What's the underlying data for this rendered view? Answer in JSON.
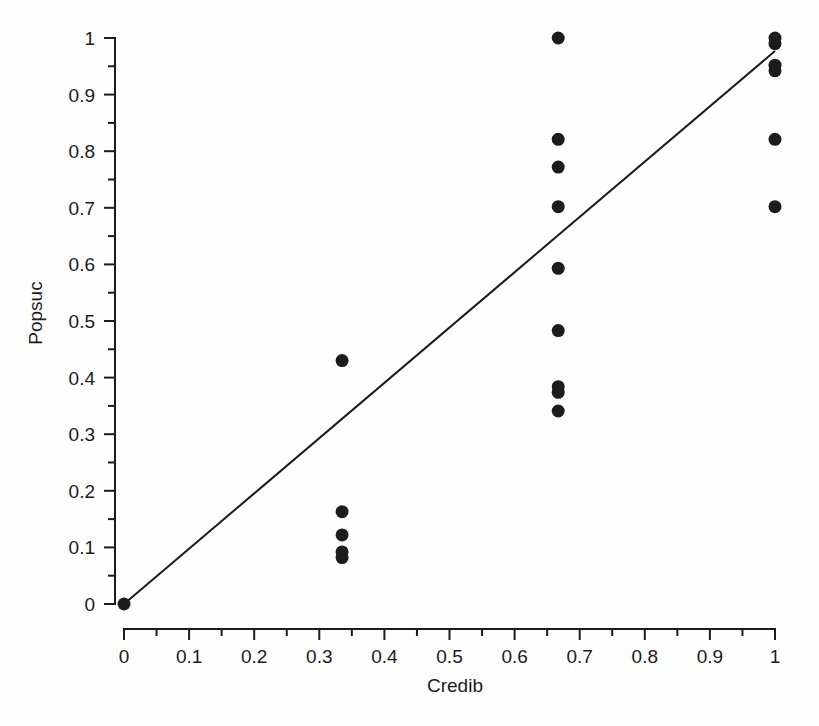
{
  "chart_data": {
    "type": "scatter",
    "title": "",
    "xlabel": "Credib",
    "ylabel": "Popsuc",
    "xlim": [
      0,
      1
    ],
    "ylim": [
      0,
      1
    ],
    "grid": false,
    "legend": null,
    "x_ticks": [
      "0",
      "0.1",
      "0.2",
      "0.3",
      "0.4",
      "0.5",
      "0.6",
      "0.7",
      "0.8",
      "0.9",
      "1"
    ],
    "x_tick_values": [
      0,
      0.1,
      0.2,
      0.3,
      0.4,
      0.5,
      0.6,
      0.7,
      0.8,
      0.9,
      1
    ],
    "x_minor_tick_values": [
      0.05,
      0.15,
      0.25,
      0.35,
      0.45,
      0.55,
      0.65,
      0.75,
      0.85,
      0.95
    ],
    "y_ticks": [
      "0",
      "0.1",
      "0.2",
      "0.3",
      "0.4",
      "0.5",
      "0.6",
      "0.7",
      "0.8",
      "0.9",
      "1"
    ],
    "y_tick_values": [
      0,
      0.1,
      0.2,
      0.3,
      0.4,
      0.5,
      0.6,
      0.7,
      0.8,
      0.9,
      1
    ],
    "y_minor_tick_values": [
      0.05,
      0.15,
      0.25,
      0.35,
      0.45,
      0.55,
      0.65,
      0.75,
      0.85,
      0.95
    ],
    "marker": "filled-circle",
    "marker_color": "#1c1c1c",
    "marker_size_px": 13,
    "points": [
      {
        "x": 0.0,
        "y": 0.0
      },
      {
        "x": 0.335,
        "y": 0.43
      },
      {
        "x": 0.335,
        "y": 0.163
      },
      {
        "x": 0.335,
        "y": 0.122
      },
      {
        "x": 0.335,
        "y": 0.092
      },
      {
        "x": 0.335,
        "y": 0.082
      },
      {
        "x": 0.667,
        "y": 1.0
      },
      {
        "x": 0.667,
        "y": 0.821
      },
      {
        "x": 0.667,
        "y": 0.772
      },
      {
        "x": 0.667,
        "y": 0.702
      },
      {
        "x": 0.667,
        "y": 0.593
      },
      {
        "x": 0.667,
        "y": 0.483
      },
      {
        "x": 0.667,
        "y": 0.384
      },
      {
        "x": 0.667,
        "y": 0.374
      },
      {
        "x": 0.667,
        "y": 0.341
      },
      {
        "x": 1.0,
        "y": 1.0
      },
      {
        "x": 1.0,
        "y": 0.99
      },
      {
        "x": 1.0,
        "y": 0.952
      },
      {
        "x": 1.0,
        "y": 0.942
      },
      {
        "x": 1.0,
        "y": 0.821
      },
      {
        "x": 1.0,
        "y": 0.702
      }
    ],
    "fit_line": {
      "name": "regression-line",
      "color": "#1b1b1b",
      "x0": 0.0,
      "y0": 0.0,
      "x1": 1.0,
      "y1": 0.977
    }
  }
}
